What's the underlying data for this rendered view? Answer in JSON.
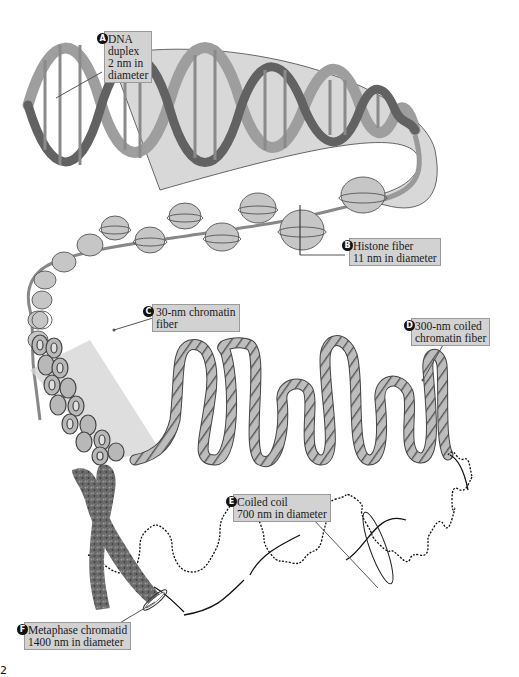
{
  "diagram": {
    "colors": {
      "label_bg": "#d2d2d2",
      "label_border": "#9a9a9a",
      "badge": "#111111",
      "strand_light": "#b0b0b0",
      "strand_dark": "#5a5a5a",
      "nucleosome": "#c4c4c4",
      "chromatid": "#6b6b6b"
    },
    "labels": [
      {
        "id": "A",
        "lines": [
          "DNA",
          "duplex",
          "2 nm in",
          "diameter"
        ]
      },
      {
        "id": "B",
        "lines": [
          "Histone fiber",
          "11 nm in diameter"
        ]
      },
      {
        "id": "C",
        "lines": [
          "30-nm chromatin",
          "fiber"
        ]
      },
      {
        "id": "D",
        "lines": [
          "300-nm coiled",
          "chromatin fiber"
        ]
      },
      {
        "id": "E",
        "lines": [
          "Coiled coil",
          "700 nm in diameter"
        ]
      },
      {
        "id": "F",
        "lines": [
          "Metaphase chromatid",
          "1400 nm in diameter"
        ]
      }
    ],
    "figure_number_fragment": "2"
  }
}
